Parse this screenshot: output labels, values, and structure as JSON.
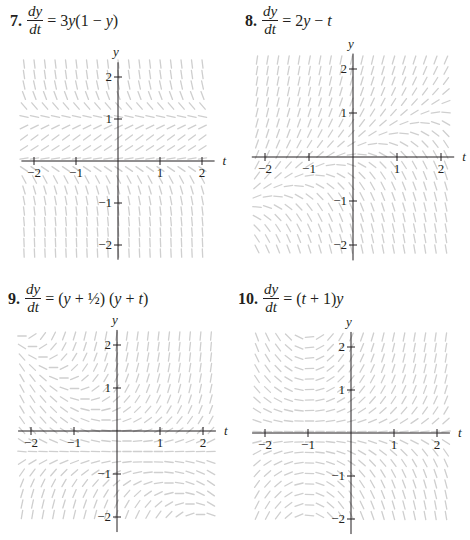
{
  "problems": [
    {
      "number": "7.",
      "lhs_top": "dy",
      "lhs_bottom": "dt",
      "rhs": "= 3y(1 − y)",
      "rhs_html_parts": [
        "= 3",
        "y",
        "(1 − ",
        "y",
        ")"
      ],
      "slope_fn": "3*y*(1-y)",
      "eq_pos": {
        "x": 10,
        "y": 4
      },
      "origin": {
        "x": 118,
        "y": 161
      },
      "unit": 42,
      "field": {
        "x0": 24,
        "x1": 212,
        "y0": 64,
        "y1": 258
      }
    },
    {
      "number": "8.",
      "lhs_top": "dy",
      "lhs_bottom": "dt",
      "rhs": "= 2y − t",
      "rhs_html_parts": [
        "= 2",
        "y",
        " − ",
        "t",
        ""
      ],
      "slope_fn": "2*y-t",
      "eq_pos": {
        "x": 245,
        "y": 4
      },
      "origin": {
        "x": 353,
        "y": 157
      },
      "unit": 44,
      "field": {
        "x0": 257,
        "x1": 448,
        "y0": 60,
        "y1": 254
      }
    },
    {
      "number": "9.",
      "lhs_top": "dy",
      "lhs_bottom": "dt",
      "rhs": "= (y + 1/2)(y + t)",
      "rhs_html_parts": [
        "= (",
        "y",
        " + ½) (",
        "y",
        " + ",
        "t",
        ")"
      ],
      "slope_fn": "(y+0.5)*(y+t)",
      "eq_pos": {
        "x": 8,
        "y": 282
      },
      "origin": {
        "x": 117,
        "y": 431
      },
      "unit": 43,
      "field": {
        "x0": 22,
        "x1": 212,
        "y0": 336,
        "y1": 524
      }
    },
    {
      "number": "10.",
      "lhs_top": "dy",
      "lhs_bottom": "dt",
      "rhs": "= (t + 1)y",
      "rhs_html_parts": [
        "= (",
        "t",
        " + 1)",
        "y",
        ""
      ],
      "slope_fn": "(t+1)*y",
      "eq_pos": {
        "x": 238,
        "y": 282
      },
      "origin": {
        "x": 351,
        "y": 433
      },
      "unit": 43,
      "field": {
        "x0": 257,
        "x1": 446,
        "y0": 337,
        "y1": 524
      }
    }
  ],
  "axes": {
    "x_label": "t",
    "y_label": "y",
    "x_ticks": [
      -2,
      -1,
      1,
      2
    ],
    "y_ticks": [
      2,
      1,
      -1,
      -2
    ],
    "x_tick_labels": [
      "−2",
      "−1",
      "1",
      "2"
    ],
    "y_tick_labels": [
      "2",
      "1",
      "−1",
      "−2"
    ]
  },
  "colors": {
    "axis": "#231f20",
    "slope_segment": "#cfcfcf",
    "text": "#231f20"
  },
  "chart_data": [
    {
      "type": "slope_field",
      "title": "7. dy/dt = 3y(1 − y)",
      "xlabel": "t",
      "ylabel": "y",
      "xlim": [
        -2.2,
        2.2
      ],
      "ylim": [
        -2.3,
        2.3
      ],
      "x_ticks": [
        -2,
        -1,
        1,
        2
      ],
      "y_ticks": [
        -2,
        -1,
        1,
        2
      ],
      "equilibria": [
        0,
        1
      ],
      "grid": false
    },
    {
      "type": "slope_field",
      "title": "8. dy/dt = 2y − t",
      "xlabel": "t",
      "ylabel": "y",
      "xlim": [
        -2.2,
        2.2
      ],
      "ylim": [
        -2.2,
        2.2
      ],
      "x_ticks": [
        -2,
        -1,
        1,
        2
      ],
      "y_ticks": [
        -2,
        -1,
        1,
        2
      ],
      "grid": false
    },
    {
      "type": "slope_field",
      "title": "9. dy/dt = (y + 1/2)(y + t)",
      "xlabel": "t",
      "ylabel": "y",
      "xlim": [
        -2.2,
        2.2
      ],
      "ylim": [
        -2.2,
        2.2
      ],
      "x_ticks": [
        -2,
        -1,
        1,
        2
      ],
      "y_ticks": [
        -2,
        -1,
        1,
        2
      ],
      "equilibria": [
        -0.5
      ],
      "grid": false
    },
    {
      "type": "slope_field",
      "title": "10. dy/dt = (t + 1)y",
      "xlabel": "t",
      "ylabel": "y",
      "xlim": [
        -2.2,
        2.2
      ],
      "ylim": [
        -2.2,
        2.2
      ],
      "x_ticks": [
        -2,
        -1,
        1,
        2
      ],
      "y_ticks": [
        -2,
        -1,
        1,
        2
      ],
      "equilibria": [
        0
      ],
      "grid": false
    }
  ]
}
